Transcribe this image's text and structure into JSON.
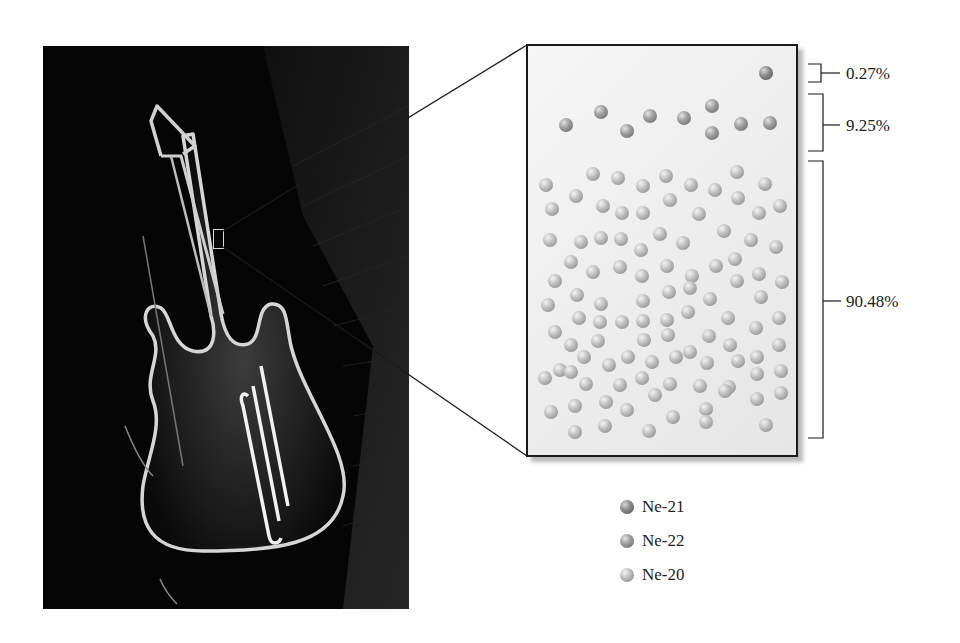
{
  "figure": {
    "photo": {
      "subject": "neon-guitar-sign",
      "description": "Neon sign shaped like an electric guitar glowing on a dark brick wall"
    },
    "zoom_box": {
      "label": "magnified-sample-of-neon-gas"
    },
    "brackets": [
      {
        "id": "ne21",
        "label": "0.27%"
      },
      {
        "id": "ne22",
        "label": "9.25%"
      },
      {
        "id": "ne20",
        "label": "90.48%"
      }
    ],
    "legend": [
      {
        "id": "ne21",
        "label": "Ne-21",
        "color": "#6a6a6a"
      },
      {
        "id": "ne22",
        "label": "Ne-22",
        "color": "#808080"
      },
      {
        "id": "ne20",
        "label": "Ne-20",
        "color": "#a8a8a8"
      }
    ],
    "atoms": {
      "ne21": [
        [
          766,
          73
        ]
      ],
      "ne22": [
        [
          566,
          125
        ],
        [
          601,
          112
        ],
        [
          627,
          131
        ],
        [
          650,
          116
        ],
        [
          684,
          118
        ],
        [
          712,
          106
        ],
        [
          712,
          133
        ],
        [
          741,
          124
        ],
        [
          770,
          123
        ]
      ],
      "ne20": [
        [
          546,
          185
        ],
        [
          593,
          174
        ],
        [
          618,
          178
        ],
        [
          643,
          186
        ],
        [
          666,
          176
        ],
        [
          691,
          185
        ],
        [
          715,
          190
        ],
        [
          737,
          172
        ],
        [
          765,
          184
        ],
        [
          552,
          209
        ],
        [
          576,
          196
        ],
        [
          603,
          206
        ],
        [
          622,
          213
        ],
        [
          643,
          213
        ],
        [
          670,
          200
        ],
        [
          699,
          214
        ],
        [
          738,
          198
        ],
        [
          759,
          213
        ],
        [
          780,
          206
        ],
        [
          550,
          240
        ],
        [
          581,
          242
        ],
        [
          601,
          238
        ],
        [
          621,
          239
        ],
        [
          641,
          250
        ],
        [
          660,
          234
        ],
        [
          683,
          243
        ],
        [
          724,
          231
        ],
        [
          751,
          240
        ],
        [
          776,
          247
        ],
        [
          571,
          262
        ],
        [
          593,
          272
        ],
        [
          620,
          267
        ],
        [
          642,
          276
        ],
        [
          667,
          266
        ],
        [
          692,
          276
        ],
        [
          716,
          266
        ],
        [
          735,
          259
        ],
        [
          759,
          274
        ],
        [
          782,
          282
        ],
        [
          555,
          281
        ],
        [
          577,
          295
        ],
        [
          601,
          304
        ],
        [
          643,
          301
        ],
        [
          669,
          292
        ],
        [
          690,
          288
        ],
        [
          710,
          299
        ],
        [
          737,
          281
        ],
        [
          761,
          297
        ],
        [
          548,
          305
        ],
        [
          579,
          318
        ],
        [
          600,
          322
        ],
        [
          622,
          322
        ],
        [
          643,
          321
        ],
        [
          667,
          320
        ],
        [
          688,
          312
        ],
        [
          728,
          318
        ],
        [
          756,
          328
        ],
        [
          779,
          318
        ],
        [
          555,
          332
        ],
        [
          571,
          345
        ],
        [
          598,
          341
        ],
        [
          644,
          340
        ],
        [
          668,
          335
        ],
        [
          690,
          352
        ],
        [
          709,
          336
        ],
        [
          730,
          345
        ],
        [
          757,
          357
        ],
        [
          560,
          370
        ],
        [
          584,
          357
        ],
        [
          609,
          365
        ],
        [
          628,
          357
        ],
        [
          652,
          362
        ],
        [
          676,
          357
        ],
        [
          707,
          363
        ],
        [
          738,
          361
        ],
        [
          779,
          345
        ],
        [
          545,
          378
        ],
        [
          571,
          372
        ],
        [
          586,
          384
        ],
        [
          620,
          385
        ],
        [
          642,
          378
        ],
        [
          670,
          384
        ],
        [
          700,
          386
        ],
        [
          729,
          387
        ],
        [
          757,
          374
        ],
        [
          781,
          371
        ],
        [
          551,
          412
        ],
        [
          575,
          406
        ],
        [
          606,
          402
        ],
        [
          627,
          410
        ],
        [
          655,
          395
        ],
        [
          673,
          417
        ],
        [
          706,
          409
        ],
        [
          725,
          391
        ],
        [
          757,
          399
        ],
        [
          781,
          393
        ],
        [
          575,
          432
        ],
        [
          605,
          426
        ],
        [
          649,
          431
        ],
        [
          706,
          422
        ],
        [
          766,
          425
        ]
      ]
    }
  }
}
